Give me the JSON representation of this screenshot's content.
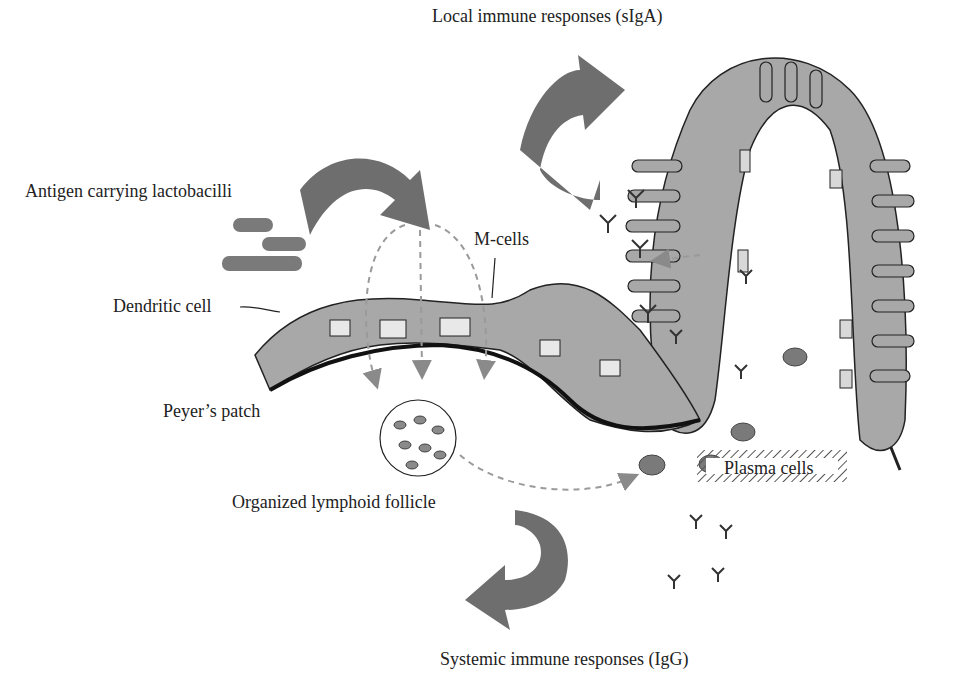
{
  "diagram": {
    "labels": {
      "local_response": "Local immune responses (sIgA)",
      "antigen": "Antigen carrying lactobacilli",
      "m_cells": "M-cells",
      "dendritic": "Dendritic cell",
      "peyers": "Peyer’s patch",
      "follicle": "Organized lymphoid follicle",
      "plasma": "Plasma cells",
      "systemic_response": "Systemic immune responses (IgG)"
    },
    "colors": {
      "epithelium": "#a8a8a8",
      "outline": "#222222",
      "arrow": "#6e6e6e",
      "dashed": "#9a9a9a",
      "plasma_cell": "#7a7a7a",
      "background": "#ffffff"
    }
  }
}
